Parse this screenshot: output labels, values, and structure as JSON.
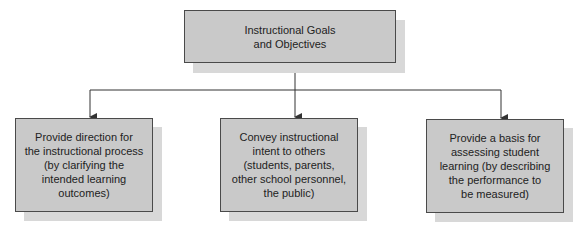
{
  "diagram": {
    "root": {
      "label": "Instructional Goals\nand Objectives"
    },
    "children": [
      {
        "label": "Provide direction for\nthe instructional process\n(by clarifying the\nintended learning\noutcomes)"
      },
      {
        "label": "Convey instructional\nintent to others\n(students, parents,\nother school personnel,\nthe public)"
      },
      {
        "label": "Provide a basis for\nassessing student\nlearning (by describing\nthe performance to\nbe measured)"
      }
    ],
    "colors": {
      "box_fill": "#c9c9c9",
      "shadow": "#d8d8d8",
      "border": "#4a4a4a",
      "line": "#333333"
    }
  }
}
